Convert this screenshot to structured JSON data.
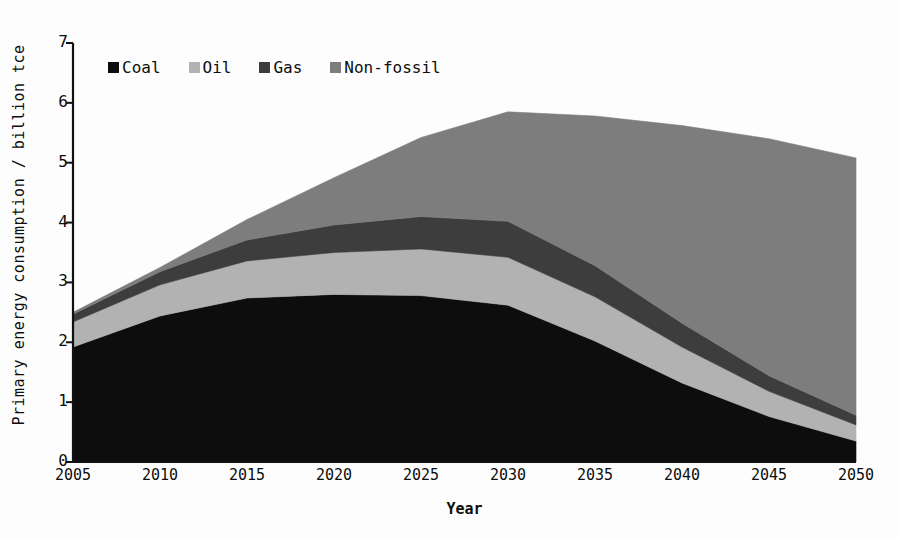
{
  "chart_data": {
    "type": "area",
    "title": "",
    "subtitle": "",
    "xlabel": "Year",
    "ylabel": "Primary energy consumption / billion tce",
    "x": [
      2005,
      2010,
      2015,
      2020,
      2025,
      2030,
      2035,
      2040,
      2045,
      2050
    ],
    "xtick_labels": [
      "2005",
      "2010",
      "2015",
      "2020",
      "2025",
      "2030",
      "2035",
      "2040",
      "2045",
      "2050"
    ],
    "ytick_labels": [
      "0",
      "1",
      "2",
      "3",
      "4",
      "5",
      "6",
      "7"
    ],
    "ytick_values": [
      0,
      1,
      2,
      3,
      4,
      5,
      6,
      7
    ],
    "xlim": [
      2005,
      2050
    ],
    "ylim": [
      0,
      7
    ],
    "grid": false,
    "stacked": true,
    "legend_position": "top-left-inside",
    "series": [
      {
        "name": "Coal",
        "color": "#0d0d0d",
        "values": [
          1.92,
          2.44,
          2.74,
          2.8,
          2.78,
          2.62,
          2.02,
          1.32,
          0.76,
          0.35
        ]
      },
      {
        "name": "Oil",
        "color": "#b2b2b2",
        "values": [
          0.42,
          0.52,
          0.62,
          0.7,
          0.78,
          0.8,
          0.74,
          0.6,
          0.42,
          0.27
        ]
      },
      {
        "name": "Gas",
        "color": "#3d3d3d",
        "values": [
          0.13,
          0.22,
          0.35,
          0.46,
          0.54,
          0.6,
          0.52,
          0.4,
          0.26,
          0.16
        ]
      },
      {
        "name": "Non-fossil",
        "color": "#7d7d7d",
        "values": [
          0.03,
          0.07,
          0.34,
          0.79,
          1.32,
          1.83,
          2.5,
          3.3,
          3.96,
          4.3
        ]
      }
    ],
    "totals": [
      2.5,
      3.25,
      4.05,
      4.75,
      5.42,
      5.85,
      5.78,
      5.62,
      5.4,
      5.08
    ]
  },
  "legend": {
    "items": [
      {
        "label": "Coal",
        "color": "#0d0d0d",
        "swatch_name": "legend-swatch-coal"
      },
      {
        "label": "Oil",
        "color": "#b2b2b2",
        "swatch_name": "legend-swatch-oil"
      },
      {
        "label": "Gas",
        "color": "#3d3d3d",
        "swatch_name": "legend-swatch-gas"
      },
      {
        "label": "Non-fossil",
        "color": "#7d7d7d",
        "swatch_name": "legend-swatch-non-fossil"
      }
    ]
  },
  "axes": {
    "y_title": "Primary energy consumption / billion tce",
    "x_title": "Year"
  }
}
